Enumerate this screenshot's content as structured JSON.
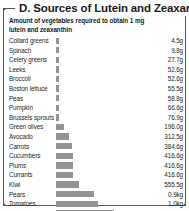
{
  "panel": {
    "title": "D. Sources of Lutein and Zeaxanthin",
    "subtitle": "Amount of vegetables required to obtain 1 mg lutein and zeaxanthin",
    "frame_color": "#58595b",
    "bar_color": "#949494",
    "text_color": "#231f20"
  },
  "chart_data": {
    "type": "bar",
    "orientation": "horizontal",
    "title": "D. Sources of Lutein and Zeaxanthin",
    "subtitle": "Amount of vegetables required to obtain 1 mg lutein and zeaxanthin",
    "xlabel": "",
    "ylabel": "",
    "unit": "g",
    "grid": false,
    "legend": false,
    "xlim": [
      0,
      2220
    ],
    "categories": [
      "Collard greens",
      "Spinach",
      "Celery greens",
      "Leeks",
      "Broccoli",
      "Boston lettuce",
      "Peas",
      "Pumpkin",
      "Brussels sprouts",
      "Green olives",
      "Avocado",
      "Carrots",
      "Cucumbers",
      "Plums",
      "Currants",
      "Kiwi",
      "Pears",
      "Tomatoes",
      "Grapes",
      "Apples"
    ],
    "values": [
      4.5,
      9.8,
      27.7,
      52.6,
      52.6,
      55.5,
      58.8,
      66.6,
      76.9,
      196.0,
      312.5,
      384.6,
      416.6,
      416.6,
      416.6,
      555.5,
      900,
      1000,
      1380,
      2220
    ],
    "value_labels": [
      "4.5g",
      "9.8g",
      "27.7g",
      "52.6g",
      "52.6g",
      "55.5g",
      "58.8g",
      "66.6g",
      "76.9g",
      "196.0g",
      "312.5g",
      "384.6g",
      "416.6g",
      "416.6g",
      "416.6g",
      "555.5g",
      "0.9kg",
      "1.0kg",
      "1.38kg",
      "2.22kg"
    ]
  }
}
